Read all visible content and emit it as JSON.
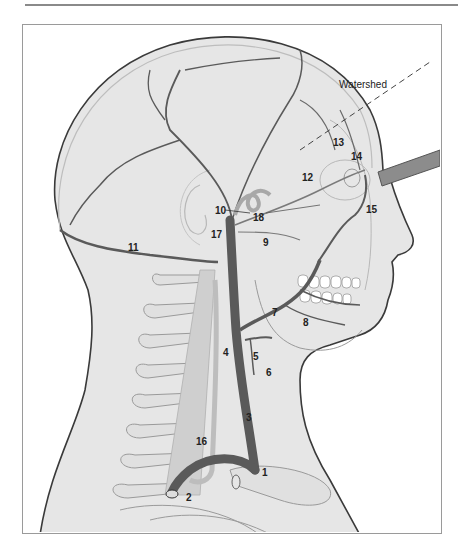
{
  "figure": {
    "annotation": {
      "text": "Watershed",
      "x": 339,
      "y": 80
    },
    "labels": [
      {
        "id": "1",
        "text": "1",
        "x": 262,
        "y": 468
      },
      {
        "id": "2",
        "text": "2",
        "x": 186,
        "y": 493
      },
      {
        "id": "3",
        "text": "3",
        "x": 246,
        "y": 413
      },
      {
        "id": "4",
        "text": "4",
        "x": 223,
        "y": 348
      },
      {
        "id": "5",
        "text": "5",
        "x": 253,
        "y": 352
      },
      {
        "id": "6",
        "text": "6",
        "x": 266,
        "y": 368
      },
      {
        "id": "7",
        "text": "7",
        "x": 272,
        "y": 308
      },
      {
        "id": "8",
        "text": "8",
        "x": 303,
        "y": 318
      },
      {
        "id": "9",
        "text": "9",
        "x": 263,
        "y": 238
      },
      {
        "id": "10",
        "text": "10",
        "x": 215,
        "y": 206
      },
      {
        "id": "11",
        "text": "11",
        "x": 128,
        "y": 243
      },
      {
        "id": "12",
        "text": "12",
        "x": 302,
        "y": 173
      },
      {
        "id": "13",
        "text": "13",
        "x": 333,
        "y": 138
      },
      {
        "id": "14",
        "text": "14",
        "x": 351,
        "y": 152
      },
      {
        "id": "15",
        "text": "15",
        "x": 366,
        "y": 205
      },
      {
        "id": "16",
        "text": "16",
        "x": 196,
        "y": 437
      },
      {
        "id": "17",
        "text": "17",
        "x": 211,
        "y": 230
      },
      {
        "id": "18",
        "text": "18",
        "x": 253,
        "y": 213
      }
    ],
    "colors": {
      "skin_fill": "#e6e6e6",
      "outline": "#3a3a3a",
      "artery": "#5a5a5a",
      "light_structure": "#c8c8c8",
      "bone_outline": "#9a9a9a",
      "frame_border": "#9a9a9a",
      "probe": "#8c8c8c"
    }
  }
}
